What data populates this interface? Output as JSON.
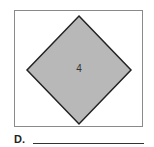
{
  "figure": {
    "shape": "square-rotated-45",
    "label": "4",
    "fill_color": "#b8b8b8",
    "stroke_color": "#222222",
    "frame_color": "#8a8a8a"
  },
  "answer": {
    "letter": "D.",
    "value": ""
  }
}
